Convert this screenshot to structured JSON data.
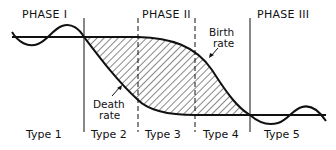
{
  "diagram": {
    "phases": [
      {
        "label": "PHASE I"
      },
      {
        "label": "PHASE II"
      },
      {
        "label": "PHASE III"
      }
    ],
    "types": [
      {
        "label": "Type 1"
      },
      {
        "label": "Type 2"
      },
      {
        "label": "Type 3"
      },
      {
        "label": "Type 4"
      },
      {
        "label": "Type 5"
      }
    ],
    "annotations": {
      "birth_rate": [
        "Birth",
        "rate"
      ],
      "death_rate": [
        "Death",
        "rate"
      ]
    },
    "dividers": [
      {
        "between": "Type 1 / Type 2",
        "style": "solid"
      },
      {
        "between": "Type 2 / Type 3",
        "style": "dashed"
      },
      {
        "between": "Type 3 / Type 4",
        "style": "dashed"
      },
      {
        "between": "Type 4 / Type 5",
        "style": "solid"
      }
    ],
    "fill_pattern": "diagonal-hatch",
    "colors": {
      "ink": "#111111",
      "background": "#ffffff"
    }
  }
}
